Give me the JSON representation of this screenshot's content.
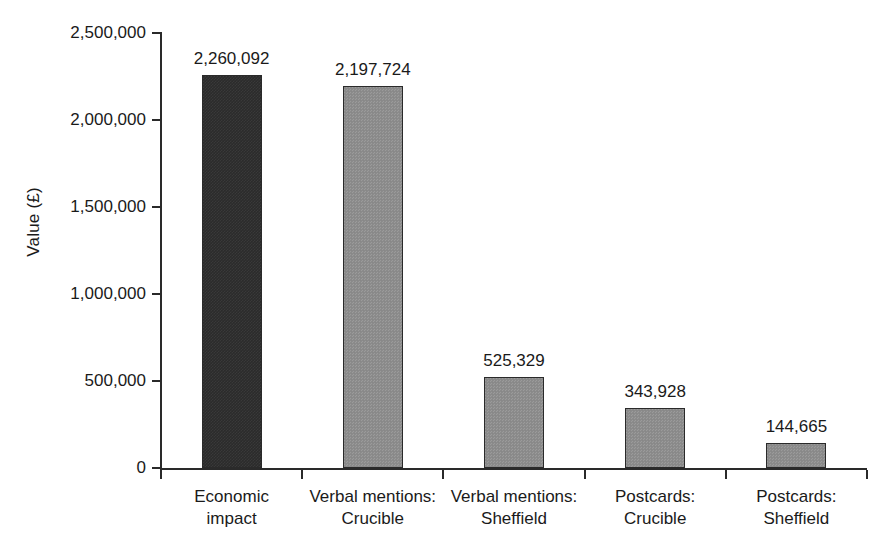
{
  "chart_data": {
    "type": "bar",
    "title": "",
    "subtitle": "",
    "xlabel": "",
    "ylabel": "Value (£)",
    "categories": [
      "Economic impact",
      "Verbal mentions: Crucible",
      "Verbal mentions: Sheffield",
      "Postcards: Crucible",
      "Postcards: Sheffield"
    ],
    "category_lines": [
      [
        "Economic",
        "impact"
      ],
      [
        "Verbal mentions:",
        "Crucible"
      ],
      [
        "Verbal mentions:",
        "Sheffield"
      ],
      [
        "Postcards:",
        "Crucible"
      ],
      [
        "Postcards:",
        "Sheffield"
      ]
    ],
    "values": [
      2260092,
      2197724,
      525329,
      343928,
      144665
    ],
    "value_labels": [
      "2,260,092",
      "2,197,724",
      "525,329",
      "343,928",
      "144,665"
    ],
    "bar_colors": [
      "#2b2b2b",
      "#8c8c8c",
      "#8c8c8c",
      "#8c8c8c",
      "#8c8c8c"
    ],
    "ylim": [
      0,
      2500000
    ],
    "ytick_values": [
      0,
      500000,
      1000000,
      1500000,
      2000000,
      2500000
    ],
    "ytick_labels": [
      "0",
      "500,000",
      "1,000,000",
      "1,500,000",
      "2,000,000",
      "2,500,000"
    ],
    "grid": false,
    "legend": false,
    "legend_position": "none"
  }
}
